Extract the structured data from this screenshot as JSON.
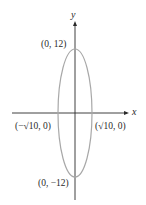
{
  "diagram": {
    "type": "ellipse-graph",
    "axes": {
      "x_label": "x",
      "y_label": "y"
    },
    "ellipse": {
      "center": [
        0,
        0
      ],
      "semi_major": 12,
      "semi_minor": "√10",
      "stroke_color": "#a8a8a8"
    },
    "points": {
      "top": "(0, 12)",
      "bottom": "(0, −12)",
      "left": "(−√10, 0)",
      "right": "(√10, 0)"
    },
    "colors": {
      "axis": "#2a2a2a",
      "ellipse": "#a8a8a8"
    }
  }
}
